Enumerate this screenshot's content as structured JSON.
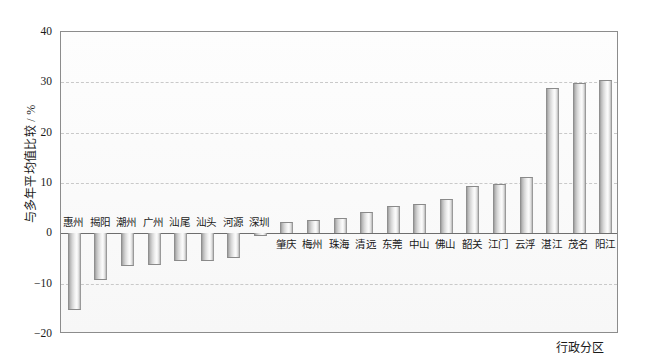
{
  "chart_data": {
    "type": "bar",
    "title": "",
    "subtitle": "",
    "xlabel": "行政分区",
    "ylabel": "与多年平均值比较 / %",
    "ylim": [
      -20,
      40
    ],
    "yticks": [
      40,
      30,
      20,
      10,
      0,
      -10,
      -20
    ],
    "ytick_labels": [
      "40",
      "30",
      "20",
      "10",
      "0",
      "−10",
      "−20"
    ],
    "grid": true,
    "grid_style": "dashed-horizontal",
    "legend": "none",
    "bar_color": "#c9c9c9",
    "bar_edge_color": "#8a8a8a",
    "axis_color": "#8c8c8c",
    "zero_line_color": "#6e6e6e",
    "categories": [
      "惠州",
      "揭阳",
      "潮州",
      "广州",
      "汕尾",
      "汕头",
      "河源",
      "深圳",
      "肇庆",
      "梅州",
      "珠海",
      "清远",
      "东莞",
      "中山",
      "佛山",
      "韶关",
      "江门",
      "云浮",
      "湛江",
      "茂名",
      "阳江"
    ],
    "values": [
      -15.2,
      -9.2,
      -6.5,
      -6.2,
      -5.5,
      -5.5,
      -5.0,
      -0.5,
      2.2,
      2.7,
      3.0,
      4.2,
      5.5,
      5.8,
      6.8,
      9.5,
      9.9,
      11.2,
      28.9,
      29.8,
      30.4
    ],
    "label_placement": [
      "above-bar",
      "above-bar",
      "above-bar",
      "above-bar",
      "above-bar",
      "above-bar",
      "above-bar",
      "above-bar",
      "below-axis",
      "below-axis",
      "below-axis",
      "below-axis",
      "below-axis",
      "below-axis",
      "below-axis",
      "below-axis",
      "below-axis",
      "below-axis",
      "below-axis",
      "below-axis",
      "below-axis"
    ]
  }
}
